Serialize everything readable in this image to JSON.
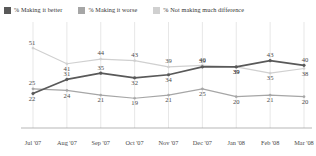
{
  "legend": {
    "items": [
      {
        "label": "% Making it better",
        "color": "#595959",
        "name": "legend-making-it-better"
      },
      {
        "label": "% Making it worse",
        "color": "#a6a6a6",
        "name": "legend-making-it-worse"
      },
      {
        "label": "% Not making much difference",
        "color": "#d0d0d0",
        "name": "legend-not-making-much-difference"
      }
    ]
  },
  "chart_data": {
    "type": "line",
    "title": "",
    "xlabel": "",
    "ylabel": "",
    "ylim": [
      0,
      60
    ],
    "grid": "vertical",
    "legend_position": "top-left",
    "categories": [
      "Jul '07",
      "Aug '07",
      "Sep '07",
      "Oct '07",
      "Nov '07",
      "Dec '07",
      "Jan '08",
      "Feb '08",
      "Mar '08"
    ],
    "series": [
      {
        "name": "% Making it better",
        "color": "#595959",
        "values": [
          22,
          31,
          35,
          32,
          34,
          39,
          39,
          43,
          40
        ],
        "label_positions": [
          "below",
          "above",
          "above",
          "below",
          "below",
          "above",
          "below",
          "above",
          "above"
        ]
      },
      {
        "name": "% Making it worse",
        "color": "#a6a6a6",
        "values": [
          25,
          24,
          21,
          19,
          21,
          25,
          20,
          21,
          20
        ],
        "label_positions": [
          "above",
          "below",
          "below",
          "below",
          "below",
          "below",
          "below",
          "below",
          "below"
        ]
      },
      {
        "name": "% Not making much difference",
        "color": "#d0d0d0",
        "values": [
          51,
          41,
          44,
          43,
          39,
          40,
          39,
          35,
          38
        ],
        "label_positions": [
          "above",
          "below",
          "above",
          "above",
          "above",
          "above",
          "below",
          "below",
          "below"
        ]
      }
    ]
  },
  "axis": {
    "ticks": [
      "Jul '07",
      "Aug '07",
      "Sep '07",
      "Oct '07",
      "Nov '07",
      "Dec '07",
      "Jan '08",
      "Feb '08",
      "Mar '08"
    ]
  }
}
